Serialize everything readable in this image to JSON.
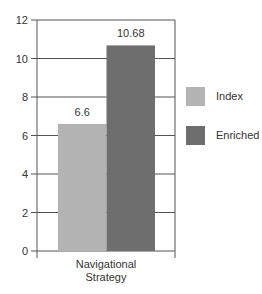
{
  "chart_data": {
    "type": "bar",
    "title": "",
    "xlabel": "",
    "ylabel": "",
    "categories": [
      "Navigational Strategy"
    ],
    "category_label_lines": [
      "Navigational",
      "Strategy"
    ],
    "series": [
      {
        "name": "Index",
        "values": [
          6.6
        ],
        "color": "#b3b3b3",
        "data_label": "6.6"
      },
      {
        "name": "Enriched",
        "values": [
          10.68
        ],
        "color": "#6e6e6e",
        "data_label": "10.68"
      }
    ],
    "ylim": [
      0,
      12
    ],
    "yticks": [
      0,
      2,
      4,
      6,
      8,
      10,
      12
    ],
    "ytick_labels": [
      "0",
      "2",
      "4",
      "6",
      "8",
      "10",
      "12"
    ],
    "grid": true,
    "legend_position": "right"
  },
  "legend": {
    "items": [
      {
        "label": "Index",
        "color": "#b3b3b3"
      },
      {
        "label": "Enriched",
        "color": "#6e6e6e"
      }
    ]
  }
}
